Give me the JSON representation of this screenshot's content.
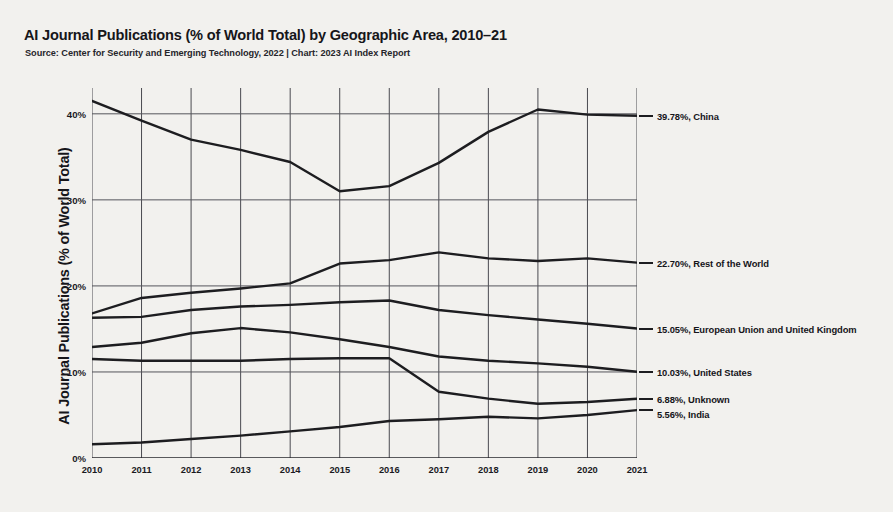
{
  "header": {
    "title": "AI Journal Publications (% of World Total) by Geographic Area, 2010–21",
    "subtitle": "Source: Center for Security and Emerging Technology, 2022 | Chart: 2023 AI Index Report"
  },
  "axes": {
    "y_title": "AI Journal Publications (% of World Total)",
    "x_title": ""
  },
  "chart_data": {
    "type": "line",
    "title": "AI Journal Publications (% of World Total) by Geographic Area, 2010–21",
    "subtitle": "Source: Center for Security and Emerging Technology, 2022 | Chart: 2023 AI Index Report",
    "xlabel": "",
    "ylabel": "AI Journal Publications (% of World Total)",
    "categories": [
      "2010",
      "2011",
      "2012",
      "2013",
      "2014",
      "2015",
      "2016",
      "2017",
      "2018",
      "2019",
      "2020",
      "2021"
    ],
    "x": [
      2010,
      2011,
      2012,
      2013,
      2014,
      2015,
      2016,
      2017,
      2018,
      2019,
      2020,
      2021
    ],
    "ylim": [
      0,
      43
    ],
    "xlim": [
      2010,
      2021
    ],
    "yticks": [
      "0%",
      "10%",
      "20%",
      "30%",
      "40%"
    ],
    "ytick_values": [
      0,
      10,
      20,
      30,
      40
    ],
    "grid": true,
    "legend_position": "right-end-labels",
    "series": [
      {
        "name": "China",
        "end_label": "39.78%, China",
        "end_value": 39.78,
        "color": "#1d1d20",
        "values": [
          41.5,
          39.2,
          37.0,
          35.8,
          34.4,
          31.0,
          31.6,
          34.3,
          37.9,
          40.5,
          39.9,
          39.78
        ]
      },
      {
        "name": "Rest of the World",
        "end_label": "22.70%, Rest of the World",
        "end_value": 22.7,
        "color": "#1d1d20",
        "values": [
          16.8,
          18.6,
          19.2,
          19.7,
          20.3,
          22.6,
          23.0,
          23.9,
          23.2,
          22.9,
          23.2,
          22.7
        ]
      },
      {
        "name": "European Union and United Kingdom",
        "end_label": "15.05%, European Union and United Kingdom",
        "end_value": 15.05,
        "color": "#1d1d20",
        "values": [
          16.3,
          16.4,
          17.2,
          17.6,
          17.8,
          18.1,
          18.3,
          17.2,
          16.6,
          16.1,
          15.6,
          15.05
        ]
      },
      {
        "name": "United States",
        "end_label": "10.03%, United States",
        "end_value": 10.03,
        "color": "#1d1d20",
        "values": [
          12.9,
          13.4,
          14.5,
          15.1,
          14.6,
          13.8,
          12.9,
          11.8,
          11.3,
          11.0,
          10.6,
          10.03
        ]
      },
      {
        "name": "Unknown",
        "end_label": "6.88%, Unknown",
        "end_value": 6.88,
        "color": "#1d1d20",
        "values": [
          11.5,
          11.3,
          11.3,
          11.3,
          11.5,
          11.6,
          11.6,
          7.7,
          6.9,
          6.3,
          6.5,
          6.88
        ]
      },
      {
        "name": "India",
        "end_label": "5.56%, India",
        "end_value": 5.56,
        "color": "#1d1d20",
        "values": [
          1.6,
          1.8,
          2.2,
          2.6,
          3.1,
          3.6,
          4.3,
          4.5,
          4.8,
          4.6,
          5.0,
          5.56
        ]
      }
    ],
    "end_labels": [
      {
        "name": "China",
        "text": "39.78%, China",
        "value": 39.78
      },
      {
        "name": "Rest of the World",
        "text": "22.70%, Rest of the World",
        "value": 22.7
      },
      {
        "name": "European Union and United Kingdom",
        "text": "15.05%, European Union and United Kingdom",
        "value": 15.05
      },
      {
        "name": "United States",
        "text": "10.03%, United States",
        "value": 10.03
      },
      {
        "name": "Unknown",
        "text": "6.88%, Unknown",
        "value": 6.88
      },
      {
        "name": "India",
        "text": "5.56%, India",
        "value": 5.56
      }
    ]
  }
}
